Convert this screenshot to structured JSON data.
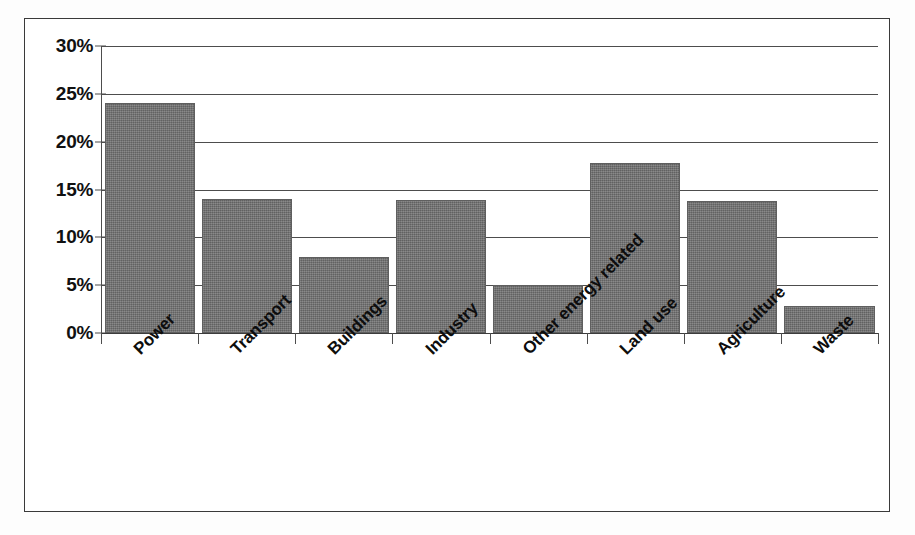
{
  "chart_data": {
    "type": "bar",
    "title": "",
    "xlabel": "",
    "ylabel": "",
    "categories": [
      "Power",
      "Transport",
      "Buildings",
      "Industry",
      "Other energy related",
      "Land use",
      "Agriculture",
      "Waste"
    ],
    "values": [
      24.0,
      14.0,
      7.9,
      13.9,
      5.0,
      17.8,
      13.8,
      2.8
    ],
    "value_labels": [
      "24%",
      "14%",
      "7.9%",
      "13.9%",
      "5%",
      "17.8%",
      "13.8%",
      "2.8%"
    ],
    "ylim": [
      0,
      30
    ],
    "y_tick_values": [
      30,
      25,
      20,
      15,
      10,
      5,
      0
    ],
    "y_tick_labels": [
      "30%",
      "25%",
      "20%",
      "15%",
      "10%",
      "5%",
      "0%"
    ],
    "grid": true,
    "grid_axis": "y",
    "legend": false,
    "legend_position": "none",
    "x_label_rotation": -45,
    "series": [
      {
        "name": "Share of emissions",
        "values": [
          24.0,
          14.0,
          7.9,
          13.9,
          5.0,
          17.8,
          13.8,
          2.8
        ]
      }
    ]
  },
  "style": {
    "bar_color": "#6f6f6f",
    "bar_edge_color": "#5f5f5f",
    "grid_color": "#4d4d4d",
    "axis_color": "#3c3c3c",
    "frame_color": "#3a3a3a",
    "plot_background": "#ffffff",
    "page_background": "#fdfdfd",
    "text_color": "#111111"
  }
}
